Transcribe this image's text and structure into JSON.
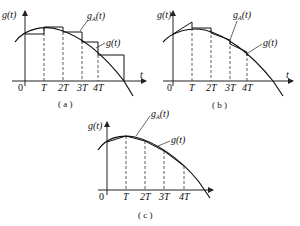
{
  "figure": {
    "panels": [
      {
        "id": "a",
        "caption": "( a )",
        "y_label": "g(t)",
        "x_label": "t",
        "origin_label": "0",
        "ticks": [
          "T",
          "2T",
          "3T",
          "4T"
        ],
        "approx_label": "g",
        "approx_sub": "A",
        "approx_arg": "(t)",
        "curve_label": "g(t)",
        "method": "staircase (zero-order hold)"
      },
      {
        "id": "b",
        "caption": "( b )",
        "y_label": "g(t)",
        "x_label": "t",
        "origin_label": "0",
        "ticks": [
          "T",
          "2T",
          "3T",
          "4T"
        ],
        "approx_label": "g",
        "approx_sub": "A",
        "approx_arg": "(t)",
        "curve_label": "g(t)",
        "method": "first-order hold (sawtooth)"
      },
      {
        "id": "c",
        "caption": "( c )",
        "y_label": "g(t)",
        "x_label": "t",
        "origin_label": "0",
        "ticks": [
          "T",
          "2T",
          "3T",
          "4T"
        ],
        "approx_label": "g",
        "approx_sub": "A",
        "approx_arg": "(t)",
        "curve_label": "g(t)",
        "method": "linear interpolation"
      }
    ]
  }
}
